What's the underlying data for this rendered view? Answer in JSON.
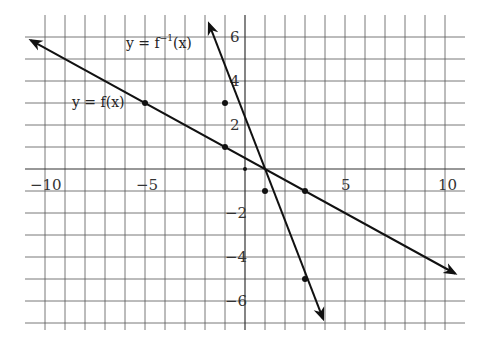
{
  "chart_data": {
    "type": "line",
    "title": "",
    "xlabel": "",
    "ylabel": "",
    "xlim": [
      -11,
      11
    ],
    "ylim": [
      -7,
      6.5
    ],
    "grid": true,
    "x_ticks": [
      -10,
      -5,
      5,
      10
    ],
    "x_tick_labels": [
      "−10",
      "−5",
      "5",
      "10"
    ],
    "y_ticks": [
      6,
      4,
      2,
      -2,
      -4,
      -6
    ],
    "y_tick_labels": [
      "6",
      "4",
      "2",
      "−2",
      "−4",
      "−6"
    ],
    "series": [
      {
        "name": "y = f(x)",
        "equation": "y = -x/2 + 1/2",
        "points": [
          [
            -5,
            3
          ],
          [
            -1,
            1
          ],
          [
            3,
            -1
          ]
        ],
        "start": [
          -10.7,
          5.85
        ],
        "end": [
          10.5,
          -4.75
        ],
        "arrows": "both"
      },
      {
        "name": "y = f⁻¹(x)",
        "equation": "y = -2x + 1",
        "points": [
          [
            -1,
            3
          ],
          [
            1,
            -1
          ],
          [
            3,
            -5
          ]
        ],
        "start": [
          -1.8,
          6.6
        ],
        "end": [
          3.9,
          -6.8
        ],
        "arrows": "both"
      }
    ],
    "extra_points": [
      [
        0,
        0
      ]
    ],
    "annotations": [
      {
        "text": "y = f(x)",
        "x": -8.6,
        "y": 3.2
      },
      {
        "text": "y = f",
        "sup": "−1",
        "rest": "(x)",
        "x": -6,
        "y": 5.6
      }
    ]
  },
  "labels": {
    "f": "y = f(x)",
    "finv_main": "y = f",
    "finv_sup": "−1",
    "finv_rest": "(x)"
  },
  "ticks": {
    "x_m10": "−10",
    "x_m5": "−5",
    "x_5": "5",
    "x_10": "10",
    "y_6": "6",
    "y_4": "4",
    "y_2": "2",
    "y_m2": "−2",
    "y_m4": "−4",
    "y_m6": "−6"
  }
}
